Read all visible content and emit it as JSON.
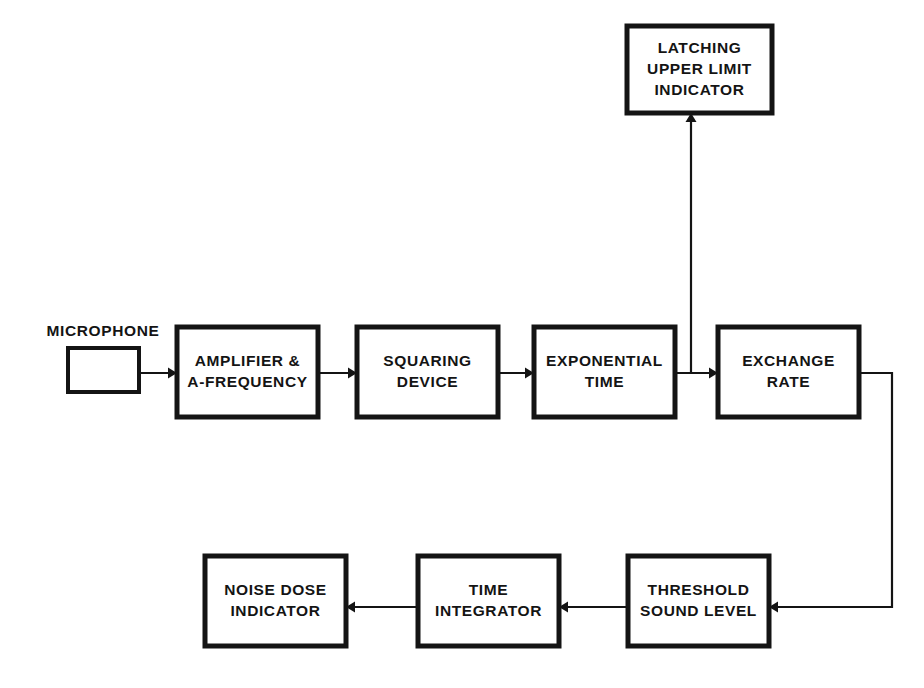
{
  "diagram": {
    "background_color": "#ffffff",
    "line_color": "#141414",
    "blocks": [
      {
        "id": "microphone",
        "name": "microphone-block",
        "lines": [],
        "external_label": "MICROPHONE",
        "x": 68,
        "y": 348,
        "w": 71,
        "h": 44,
        "stroke": "thin"
      },
      {
        "id": "amplifier",
        "name": "amplifier-a-frequency-block",
        "lines": [
          "AMPLIFIER &",
          "A-FREQUENCY"
        ],
        "external_label": "",
        "x": 177,
        "y": 327,
        "w": 141,
        "h": 90,
        "stroke": "thick"
      },
      {
        "id": "squaring",
        "name": "squaring-device-block",
        "lines": [
          "SQUARING",
          "DEVICE"
        ],
        "external_label": "",
        "x": 357,
        "y": 327,
        "w": 141,
        "h": 90,
        "stroke": "thick"
      },
      {
        "id": "exponential",
        "name": "exponential-time-block",
        "lines": [
          "EXPONENTIAL",
          "TIME"
        ],
        "external_label": "",
        "x": 534,
        "y": 327,
        "w": 141,
        "h": 90,
        "stroke": "thick"
      },
      {
        "id": "exchange",
        "name": "exchange-rate-block",
        "lines": [
          "EXCHANGE",
          "RATE"
        ],
        "external_label": "",
        "x": 718,
        "y": 327,
        "w": 141,
        "h": 90,
        "stroke": "thick"
      },
      {
        "id": "latching",
        "name": "latching-upper-limit-indicator-block",
        "lines": [
          "LATCHING",
          "UPPER  LIMIT",
          "INDICATOR"
        ],
        "external_label": "",
        "x": 627,
        "y": 26,
        "w": 145,
        "h": 87,
        "stroke": "thick"
      },
      {
        "id": "threshold",
        "name": "threshold-sound-level-block",
        "lines": [
          "THRESHOLD",
          "SOUND LEVEL"
        ],
        "external_label": "",
        "x": 628,
        "y": 556,
        "w": 141,
        "h": 90,
        "stroke": "thick"
      },
      {
        "id": "integrator",
        "name": "time-integrator-block",
        "lines": [
          "TIME",
          "INTEGRATOR"
        ],
        "external_label": "",
        "x": 418,
        "y": 556,
        "w": 141,
        "h": 90,
        "stroke": "thick"
      },
      {
        "id": "noisedose",
        "name": "noise-dose-indicator-block",
        "lines": [
          "NOISE DOSE",
          "INDICATOR"
        ],
        "external_label": "",
        "x": 205,
        "y": 556,
        "w": 141,
        "h": 90,
        "stroke": "thick"
      }
    ],
    "external_labels": [
      {
        "name": "microphone-label",
        "text": "MICROPHONE",
        "x": 103,
        "y": 332
      }
    ],
    "connectors": [
      {
        "name": "connector-microphone-to-amplifier",
        "from": "microphone",
        "to": "amplifier",
        "points": "139,373 177,373",
        "arrow": {
          "x": 177,
          "y": 373,
          "dir": "right"
        }
      },
      {
        "name": "connector-amplifier-to-squaring",
        "from": "amplifier",
        "to": "squaring",
        "points": "318,373 357,373",
        "arrow": {
          "x": 357,
          "y": 373,
          "dir": "right"
        }
      },
      {
        "name": "connector-squaring-to-exponential",
        "from": "squaring",
        "to": "exponential",
        "points": "498,373 534,373",
        "arrow": {
          "x": 534,
          "y": 373,
          "dir": "right"
        }
      },
      {
        "name": "connector-exponential-to-exchange",
        "from": "exponential",
        "to": "exchange",
        "points": "675,373 718,373",
        "arrow": {
          "x": 718,
          "y": 373,
          "dir": "right"
        }
      },
      {
        "name": "connector-exponential-to-latching",
        "from": "exponential",
        "to": "latching",
        "points": "691,373 691,113",
        "arrow": {
          "x": 691,
          "y": 113,
          "dir": "up"
        }
      },
      {
        "name": "connector-exchange-to-threshold",
        "from": "exchange",
        "to": "threshold",
        "points": "859,373 892,373 892,607 769,607",
        "arrow": {
          "x": 769,
          "y": 607,
          "dir": "left"
        }
      },
      {
        "name": "connector-threshold-to-integrator",
        "from": "threshold",
        "to": "integrator",
        "points": "628,607 559,607",
        "arrow": {
          "x": 559,
          "y": 607,
          "dir": "left"
        }
      },
      {
        "name": "connector-integrator-to-noisedose",
        "from": "integrator",
        "to": "noisedose",
        "points": "418,607 346,607",
        "arrow": {
          "x": 346,
          "y": 607,
          "dir": "left"
        }
      }
    ]
  }
}
